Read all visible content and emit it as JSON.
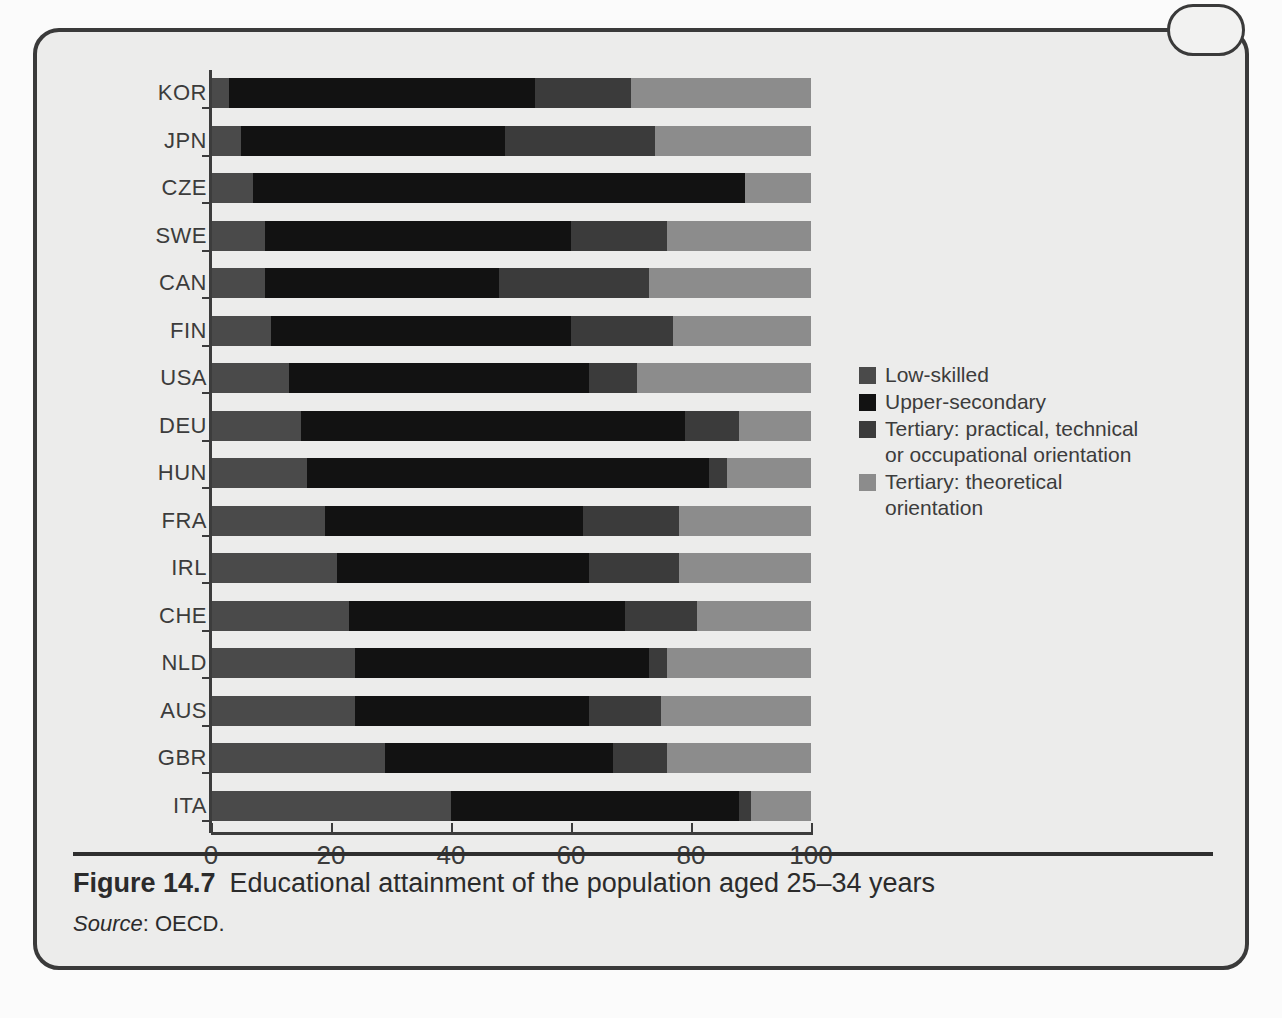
{
  "figure": {
    "number_label": "Figure 14.7",
    "caption": "Educational attainment of the population aged 25–34 years",
    "source_label": "Source",
    "source_value": ": OECD."
  },
  "ghost_text": {
    "left_col": "the country — institutional features\nof the education and training system\nmatter a great deal for the way in\nwhich young people make the\ntransition into employment and for\nthe degree to which initial skills\nare matched to the requirements of\nthe jobs available in the economy.",
    "right_col": "Figure 14.7 shows\nthat in most OECD countries\nan increasing proportion of\nyoung adults has completed\nupper-secondary education and\nmoved on to tertiary study.\nThe composition of tertiary\nattainment differs widely across\ncountries, reflecting different\nnational traditions in vocational\nand academic provision."
  },
  "chart_data": {
    "type": "bar",
    "orientation": "horizontal",
    "stacked": true,
    "stacked_percent": true,
    "title": "Educational attainment of the population aged 25–34 years",
    "xlabel": "",
    "ylabel": "",
    "xlim": [
      0,
      100
    ],
    "xticks": [
      0,
      20,
      40,
      60,
      80,
      100
    ],
    "xtick_labels": [
      "0",
      "20",
      "40",
      "60",
      "80",
      "100"
    ],
    "grid": false,
    "legend_position": "right",
    "categories": [
      "KOR",
      "JPN",
      "CZE",
      "SWE",
      "CAN",
      "FIN",
      "USA",
      "DEU",
      "HUN",
      "FRA",
      "IRL",
      "CHE",
      "NLD",
      "AUS",
      "GBR",
      "ITA"
    ],
    "series": [
      {
        "name": "Low-skilled",
        "color": "#4a4a4a",
        "values": [
          3,
          5,
          7,
          9,
          9,
          10,
          13,
          15,
          16,
          19,
          21,
          23,
          24,
          24,
          29,
          40
        ]
      },
      {
        "name": "Upper-secondary",
        "color": "#121212",
        "values": [
          51,
          44,
          82,
          51,
          39,
          50,
          50,
          64,
          67,
          43,
          42,
          46,
          49,
          39,
          38,
          48
        ]
      },
      {
        "name": "Tertiary: practical, technical\nor occupational orientation",
        "color": "#3b3b3b",
        "values": [
          16,
          25,
          0,
          16,
          25,
          17,
          8,
          9,
          3,
          16,
          15,
          12,
          3,
          12,
          9,
          2
        ]
      },
      {
        "name": "Tertiary: theoretical\norientation",
        "color": "#8c8c8c",
        "values": [
          30,
          26,
          11,
          24,
          27,
          23,
          29,
          12,
          14,
          22,
          22,
          19,
          24,
          25,
          24,
          10
        ]
      }
    ]
  }
}
